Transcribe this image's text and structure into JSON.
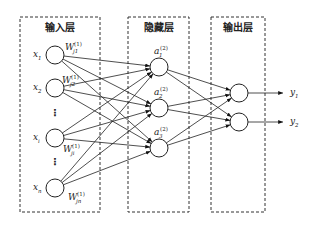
{
  "diagram": {
    "type": "neural-network",
    "layers": [
      {
        "title": "输入层",
        "box": {
          "x": 20,
          "y": 17,
          "w": 80,
          "h": 195
        }
      },
      {
        "title": "隐藏层",
        "box": {
          "x": 128,
          "y": 17,
          "w": 61,
          "h": 195
        }
      },
      {
        "title": "输出层",
        "box": {
          "x": 211,
          "y": 17,
          "w": 54,
          "h": 195
        }
      }
    ],
    "input_nodes": [
      {
        "label": "x",
        "sub": "1",
        "cx": 55,
        "cy": 55
      },
      {
        "label": "x",
        "sub": "2",
        "cx": 55,
        "cy": 88
      },
      {
        "label": "x",
        "sub": "i",
        "cx": 55,
        "cy": 138
      },
      {
        "label": "x",
        "sub": "n",
        "cx": 55,
        "cy": 188
      }
    ],
    "hidden_nodes": [
      {
        "label": "a",
        "sub": "1",
        "sup": "(2)",
        "cx": 159,
        "cy": 67
      },
      {
        "label": "a",
        "sub": "2",
        "sup": "(2)",
        "cx": 159,
        "cy": 108
      },
      {
        "label": "a",
        "sub": "3",
        "sup": "(2)",
        "cx": 159,
        "cy": 148
      }
    ],
    "output_nodes": [
      {
        "label": "y",
        "sub": "1",
        "cx": 239,
        "cy": 93
      },
      {
        "label": "y",
        "sub": "2",
        "cx": 239,
        "cy": 122
      }
    ],
    "weights": [
      {
        "label": "W",
        "sub": "j1",
        "sup": "(1)",
        "x": 65,
        "y": 50
      },
      {
        "label": "W",
        "sub": "j2",
        "sup": "(1)",
        "x": 62,
        "y": 83
      },
      {
        "label": "W",
        "sub": "ji",
        "sup": "(1)",
        "x": 63,
        "y": 152
      },
      {
        "label": "W",
        "sub": "jn",
        "sup": "(1)",
        "x": 68,
        "y": 200
      }
    ],
    "ellipsis": "⋮",
    "node_radius": 9
  }
}
